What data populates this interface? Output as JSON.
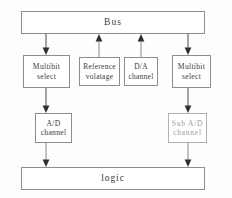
{
  "diagram": {
    "background_color": "#fdfdfd",
    "box_border_color": "#8d8d8d",
    "text_color": "#3a3a3a",
    "muted_text_color": "#9c9c9c",
    "arrow_color": "#4a4a4a"
  },
  "rows": {
    "bus": {
      "label": "Bus"
    },
    "middle": {
      "multibit_left": {
        "line1": "Multibit",
        "line2": "select"
      },
      "reference": {
        "line1": "Reference",
        "line2": "volatage"
      },
      "da_channel": {
        "line1": "D/A",
        "line2": "channel"
      },
      "multibit_right": {
        "line1": "Multibit",
        "line2": "select"
      }
    },
    "channels": {
      "ad_channel": {
        "line1": "A/D",
        "line2": "channel"
      },
      "sub_ad_channel": {
        "line1": "Sub A/D",
        "line2": "channel"
      }
    },
    "logic": {
      "label": "logic"
    }
  },
  "connectors": [
    {
      "name": "bus-to-multibit-left",
      "direction": "down"
    },
    {
      "name": "reference-to-bus",
      "direction": "up"
    },
    {
      "name": "da-channel-to-bus",
      "direction": "up"
    },
    {
      "name": "bus-to-multibit-right",
      "direction": "down"
    },
    {
      "name": "multibit-left-to-ad-channel",
      "direction": "down"
    },
    {
      "name": "multibit-right-to-sub-ad-channel",
      "direction": "down"
    },
    {
      "name": "ad-channel-to-logic",
      "direction": "down"
    },
    {
      "name": "sub-ad-channel-to-logic",
      "direction": "down"
    }
  ]
}
